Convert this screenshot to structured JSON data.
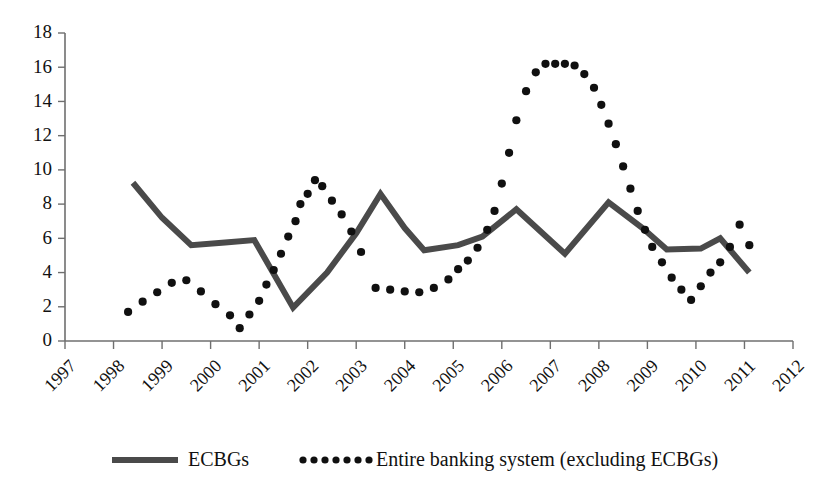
{
  "chart_data": {
    "type": "line",
    "title": "",
    "subtitle": "",
    "xlabel": "",
    "ylabel": "",
    "xlim": [
      1997,
      2012
    ],
    "ylim": [
      0,
      18
    ],
    "ytick_step": 2,
    "grid": false,
    "legend_position": "bottom",
    "x_ticks": [
      "1997",
      "1998",
      "1999",
      "2000",
      "2001",
      "2002",
      "2003",
      "2004",
      "2005",
      "2006",
      "2007",
      "2008",
      "2009",
      "2010",
      "2011",
      "2012"
    ],
    "y_ticks": [
      "0",
      "2",
      "4",
      "6",
      "8",
      "10",
      "12",
      "14",
      "16",
      "18"
    ],
    "series": [
      {
        "name": "ECBGs",
        "style": "solid-thick",
        "color": "#4a4a4a",
        "x": [
          1998.4,
          1999.0,
          1999.6,
          2000.3,
          2000.9,
          2001.7,
          2002.4,
          2003.0,
          2003.5,
          2004.0,
          2004.4,
          2005.1,
          2005.6,
          2006.3,
          2007.3,
          2008.2,
          2008.9,
          2009.4,
          2010.1,
          2010.5,
          2011.1
        ],
        "y": [
          9.25,
          7.2,
          5.6,
          5.75,
          5.9,
          1.95,
          4.0,
          6.3,
          8.6,
          6.6,
          5.3,
          5.6,
          6.1,
          7.7,
          5.1,
          8.1,
          6.6,
          5.35,
          5.4,
          6.0,
          4.0
        ]
      },
      {
        "name": "Entire banking system (excluding ECBGs)",
        "style": "dotted",
        "color": "#101010",
        "x": [
          1998.3,
          1998.6,
          1998.9,
          1999.2,
          1999.5,
          1999.8,
          2000.1,
          2000.4,
          2000.6,
          2000.8,
          2001.0,
          2001.15,
          2001.3,
          2001.45,
          2001.6,
          2001.75,
          2001.85,
          2002.0,
          2002.15,
          2002.3,
          2002.5,
          2002.7,
          2002.9,
          2003.1,
          2003.4,
          2003.7,
          2004.0,
          2004.3,
          2004.6,
          2004.9,
          2005.1,
          2005.3,
          2005.5,
          2005.7,
          2005.85,
          2006.0,
          2006.15,
          2006.3,
          2006.5,
          2006.7,
          2006.9,
          2007.1,
          2007.3,
          2007.5,
          2007.7,
          2007.9,
          2008.05,
          2008.2,
          2008.35,
          2008.5,
          2008.65,
          2008.8,
          2008.95,
          2009.1,
          2009.3,
          2009.5,
          2009.7,
          2009.9,
          2010.1,
          2010.3,
          2010.5,
          2010.7,
          2010.9,
          2011.1
        ],
        "y": [
          1.7,
          2.3,
          2.85,
          3.4,
          3.55,
          2.9,
          2.15,
          1.5,
          0.75,
          1.55,
          2.35,
          3.3,
          4.15,
          5.1,
          6.1,
          7.0,
          8.0,
          8.6,
          9.4,
          9.05,
          8.2,
          7.4,
          6.4,
          5.2,
          3.1,
          3.0,
          2.9,
          2.85,
          3.1,
          3.6,
          4.2,
          4.7,
          5.45,
          6.5,
          7.6,
          9.2,
          11.0,
          12.9,
          14.6,
          15.7,
          16.2,
          16.2,
          16.2,
          16.1,
          15.6,
          14.8,
          13.8,
          12.7,
          11.5,
          10.2,
          8.9,
          7.6,
          6.5,
          5.5,
          4.6,
          3.7,
          3.0,
          2.4,
          3.2,
          4.0,
          4.6,
          5.5,
          6.8,
          5.6
        ]
      }
    ],
    "legend": [
      {
        "label": "ECBGs",
        "marker": "solid-line",
        "color": "#4a4a4a"
      },
      {
        "label": "Entire banking system (excluding ECBGs)",
        "marker": "dotted-line",
        "color": "#101010"
      }
    ]
  }
}
